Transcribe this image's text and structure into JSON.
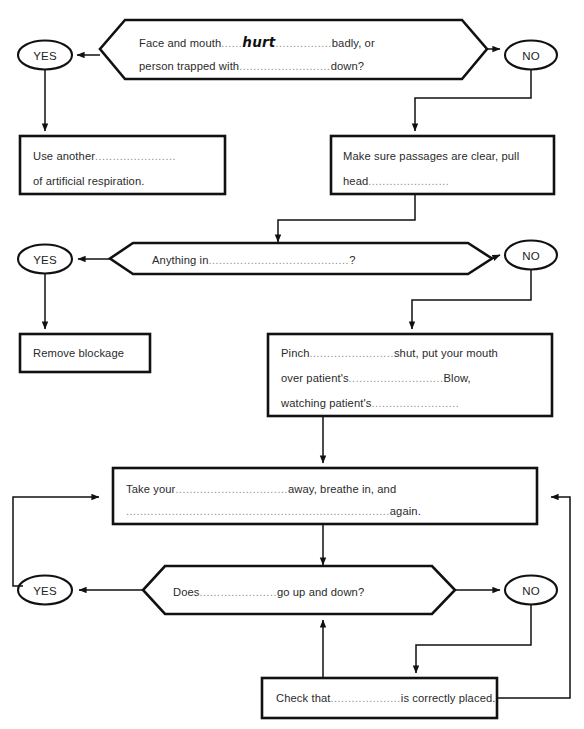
{
  "document": {
    "title": "Artificial respiration flowchart worksheet",
    "type": "flowchart",
    "ink_color": "#111111",
    "text_color": "#2b2b2b",
    "dot_color": "#8a8a8a",
    "background": "#ffffff"
  },
  "nodes": {
    "q1": {
      "shape": "hexagon",
      "line1_a": "Face and mouth",
      "line1_dots1": "......",
      "line1_answer": "hurt",
      "line1_dots2": "................",
      "line1_b": "badly, or",
      "line2_a": "person trapped with",
      "line2_dots": "..........................",
      "line2_b": "down?"
    },
    "q1_yes": {
      "shape": "ellipse",
      "label": "YES"
    },
    "q1_no": {
      "shape": "ellipse",
      "label": "NO"
    },
    "use_another": {
      "shape": "rect",
      "line1_a": "Use another",
      "line1_dots": ".......................",
      "line2": "of artificial respiration."
    },
    "make_sure": {
      "shape": "rect",
      "line1": "Make sure passages are clear, pull",
      "line2_a": "head",
      "line2_dots": "......................."
    },
    "q2": {
      "shape": "hexagon",
      "line1_a": "Anything in",
      "line1_dots": "........................................",
      "line1_b": "?"
    },
    "q2_yes": {
      "shape": "ellipse",
      "label": "YES"
    },
    "q2_no": {
      "shape": "ellipse",
      "label": "NO"
    },
    "remove_blockage": {
      "shape": "rect",
      "line1": "Remove blockage"
    },
    "pinch": {
      "shape": "rect",
      "line1_a": "Pinch",
      "line1_dots": "........................",
      "line1_b": "shut, put your mouth",
      "line2_a": "over patient's",
      "line2_dots": "...........................",
      "line2_b": "Blow,",
      "line3_a": "watching patient's",
      "line3_dots": "........................."
    },
    "take_your": {
      "shape": "rect",
      "line1_a": "Take your",
      "line1_dots": "................................",
      "line1_b": "away, breathe in, and",
      "line2_dots": "...........................................................................",
      "line2_b": "again."
    },
    "q3": {
      "shape": "hexagon",
      "line1_a": "Does",
      "line1_dots": "......................",
      "line1_b": "go up and down?"
    },
    "q3_yes": {
      "shape": "ellipse",
      "label": "YES"
    },
    "q3_no": {
      "shape": "ellipse",
      "label": "NO"
    },
    "check_that": {
      "shape": "rect",
      "line1_a": "Check that",
      "line1_dots": "....................",
      "line1_b": "is correctly placed."
    }
  }
}
